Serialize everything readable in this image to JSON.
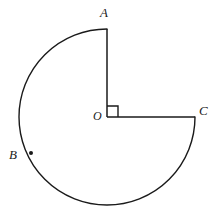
{
  "figure": {
    "kind": "geometry-diagram",
    "background_color": "#ffffff",
    "stroke_color": "#1a1a1a",
    "stroke_width": 1.4,
    "circle": {
      "center": {
        "x": 107,
        "y": 117
      },
      "radius": 88
    },
    "labels": {
      "A": "A",
      "B": "B",
      "C": "C",
      "O": "O"
    },
    "points": {
      "A": {
        "x": 107,
        "y": 29,
        "angle_deg": 90
      },
      "B": {
        "x": 31,
        "y": 153,
        "angle_deg": 205
      },
      "C": {
        "x": 195,
        "y": 117,
        "angle_deg": 0
      },
      "O": {
        "x": 107,
        "y": 117
      }
    },
    "radii": [
      {
        "name": "OA",
        "from": "O",
        "to": "A"
      },
      {
        "name": "OC",
        "from": "O",
        "to": "C"
      }
    ],
    "arc": {
      "name": "major-arc-ABC",
      "from": "A",
      "through": "B",
      "to": "C",
      "sweep": "counterclockwise",
      "measure_deg": 270
    },
    "right_angle_marker": {
      "at": "O",
      "size": 11,
      "between": [
        "OA",
        "OC"
      ]
    },
    "point_marker": {
      "at": "B",
      "shape": "dot",
      "size": 4
    },
    "paths": {
      "major_arc": "M 107 29 A 88 88 0 1 0 195 117",
      "radius_OA": "M 107 117 L 107 29",
      "radius_OC": "M 107 117 L 195 117",
      "right_angle": "M 107 106 L 118 106 L 118 117"
    }
  }
}
